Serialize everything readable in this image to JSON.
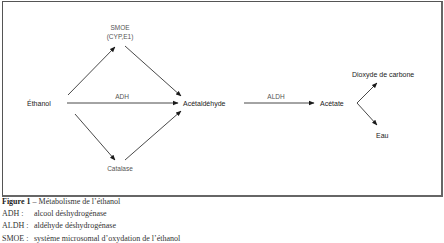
{
  "diagram": {
    "nodes": {
      "ethanol": "Éthanol",
      "acetaldehyde": "Acétaldéhyde",
      "acetate": "Acétate",
      "co2": "Dioxyde de carbone",
      "water": "Eau"
    },
    "enzymes": {
      "smoe_line1": "SMOE",
      "smoe_line2": "(CYP,E1)",
      "adh": "ADH",
      "catalase": "Catalase",
      "aldh": "ALDH"
    },
    "colors": {
      "arrow": "#1a1a1a",
      "frame": "#555555",
      "enzyme_text": "#555555"
    }
  },
  "caption": {
    "figure_label": "Figure 1",
    "figure_title": " – Métabolisme de l’éthanol",
    "legend": [
      {
        "abbr": "ADH :",
        "text": "alcool déshydrogénase"
      },
      {
        "abbr": "ALDH :",
        "text": "aldéhyde déshydrogénase"
      },
      {
        "abbr": "SMOE :",
        "text": "système microsomal d’oxydation de l’éthanol"
      }
    ]
  }
}
